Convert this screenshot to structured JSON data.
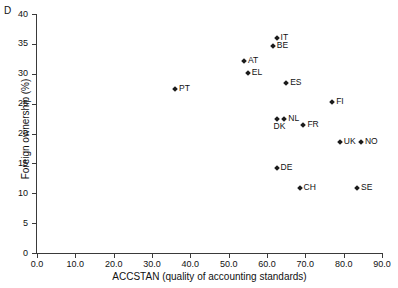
{
  "panel": {
    "letter": "D"
  },
  "chart_data": {
    "type": "scatter",
    "title": "",
    "xlabel": "ACCSTAN (quality of accounting standards)",
    "ylabel": "Foreign ownership (%)",
    "xlim": [
      0.0,
      90.0
    ],
    "ylim": [
      0,
      40
    ],
    "xticks": [
      "0.0",
      "10.0",
      "20.0",
      "30.0",
      "40.0",
      "50.0",
      "60.0",
      "70.0",
      "80.0",
      "90.0"
    ],
    "xtick_values": [
      0,
      10,
      20,
      30,
      40,
      50,
      60,
      70,
      80,
      90
    ],
    "yticks": [
      "0",
      "5",
      "10",
      "15",
      "20",
      "25",
      "30",
      "35",
      "40"
    ],
    "ytick_values": [
      0,
      5,
      10,
      15,
      20,
      25,
      30,
      35,
      40
    ],
    "grid": false,
    "legend": "none",
    "marker": "diamond",
    "marker_color": "#1b1b1b",
    "points": [
      {
        "label": "IT",
        "x": 62.5,
        "y": 35.9,
        "label_pos": "right"
      },
      {
        "label": "BE",
        "x": 61.5,
        "y": 34.6,
        "label_pos": "right"
      },
      {
        "label": "AT",
        "x": 54.0,
        "y": 32.2,
        "label_pos": "right"
      },
      {
        "label": "EL",
        "x": 55.0,
        "y": 30.2,
        "label_pos": "right"
      },
      {
        "label": "ES",
        "x": 65.0,
        "y": 28.5,
        "label_pos": "right"
      },
      {
        "label": "PT",
        "x": 36.0,
        "y": 27.5,
        "label_pos": "right"
      },
      {
        "label": "FI",
        "x": 77.0,
        "y": 25.3,
        "label_pos": "right"
      },
      {
        "label": "NL",
        "x": 64.5,
        "y": 22.5,
        "label_pos": "right"
      },
      {
        "label": "DK",
        "x": 62.5,
        "y": 22.5,
        "label_pos": "below"
      },
      {
        "label": "FR",
        "x": 69.5,
        "y": 21.5,
        "label_pos": "right"
      },
      {
        "label": "UK",
        "x": 79.0,
        "y": 18.6,
        "label_pos": "right"
      },
      {
        "label": "NO",
        "x": 84.5,
        "y": 18.6,
        "label_pos": "right"
      },
      {
        "label": "DE",
        "x": 62.5,
        "y": 14.3,
        "label_pos": "right"
      },
      {
        "label": "CH",
        "x": 68.5,
        "y": 10.9,
        "label_pos": "right"
      },
      {
        "label": "SE",
        "x": 83.5,
        "y": 10.9,
        "label_pos": "right"
      }
    ]
  }
}
